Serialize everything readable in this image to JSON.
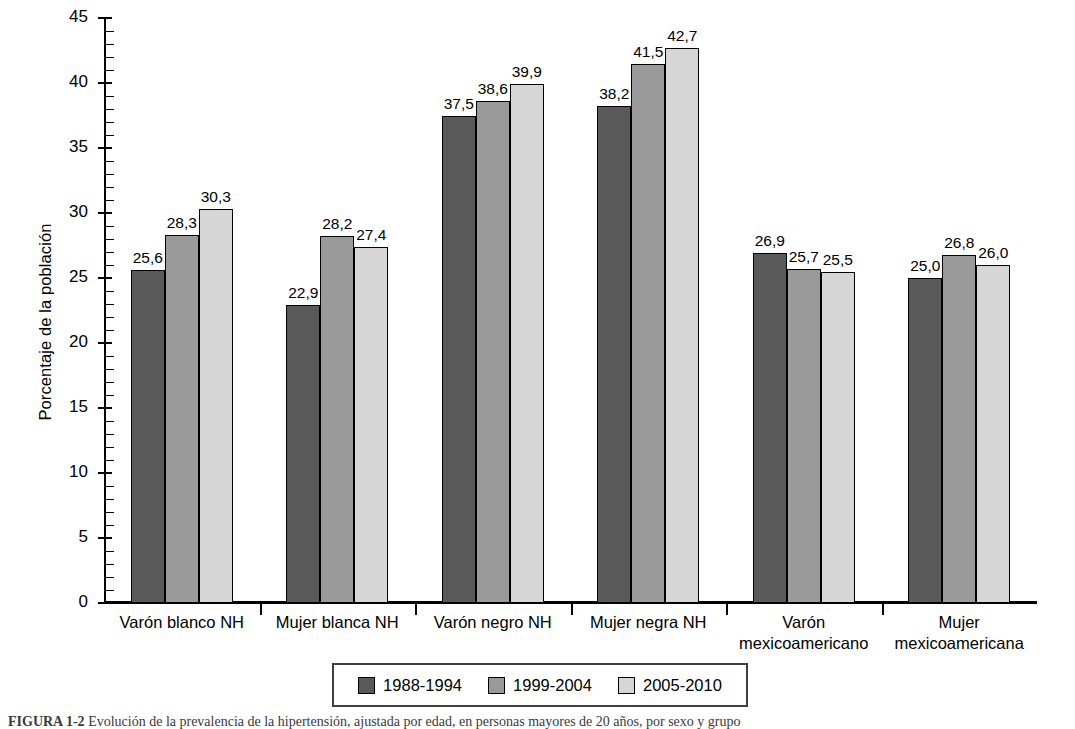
{
  "chart_data": {
    "type": "bar",
    "title": "",
    "xlabel": "",
    "ylabel": "Porcentaje de la población",
    "ylim": [
      0,
      45
    ],
    "ytick_step": 5,
    "yminor_step": 1,
    "grid": false,
    "legend_position": "bottom-center",
    "decimal_separator": ",",
    "categories": [
      "Varón blanco NH",
      "Mujer blanca NH",
      "Varón negro NH",
      "Mujer negra NH",
      "Varón\nmexicoamericano",
      "Mujer\nmexicoamericana"
    ],
    "category_lines": [
      [
        "Varón blanco NH"
      ],
      [
        "Mujer blanca NH"
      ],
      [
        "Varón negro NH"
      ],
      [
        "Mujer negra NH"
      ],
      [
        "Varón",
        "mexicoamericano"
      ],
      [
        "Mujer",
        "mexicoamericana"
      ]
    ],
    "yticks": [
      0,
      5,
      10,
      15,
      20,
      25,
      30,
      35,
      40,
      45
    ],
    "ytick_labels": [
      "0",
      "5",
      "10",
      "15",
      "20",
      "25",
      "30",
      "35",
      "40",
      "45"
    ],
    "series": [
      {
        "name": "1988-1994",
        "color": "#595959",
        "values": [
          25.6,
          22.9,
          37.5,
          38.2,
          26.9,
          25.0
        ],
        "labels": [
          "25,6",
          "22,9",
          "37,5",
          "38,2",
          "26,9",
          "25,0"
        ]
      },
      {
        "name": "1999-2004",
        "color": "#9a9a9a",
        "values": [
          28.3,
          28.2,
          38.6,
          41.5,
          25.7,
          26.8
        ],
        "labels": [
          "28,3",
          "28,2",
          "38,6",
          "41,5",
          "25,7",
          "26,8"
        ]
      },
      {
        "name": "2005-2010",
        "color": "#d6d6d6",
        "values": [
          30.3,
          27.4,
          39.9,
          42.7,
          25.5,
          26.0
        ],
        "labels": [
          "30,3",
          "27,4",
          "39,9",
          "42,7",
          "25,5",
          "26,0"
        ]
      }
    ]
  },
  "legend": {
    "items": [
      {
        "label": "1988-1994",
        "color": "#595959"
      },
      {
        "label": "1999-2004",
        "color": "#9a9a9a"
      },
      {
        "label": "2005-2010",
        "color": "#d6d6d6"
      }
    ]
  },
  "caption": {
    "figure_number": "FIGURA 1-2",
    "text": "Evolución de la prevalencia de la hipertensión, ajustada por edad, en personas mayores de 20 años, por sexo y grupo"
  }
}
